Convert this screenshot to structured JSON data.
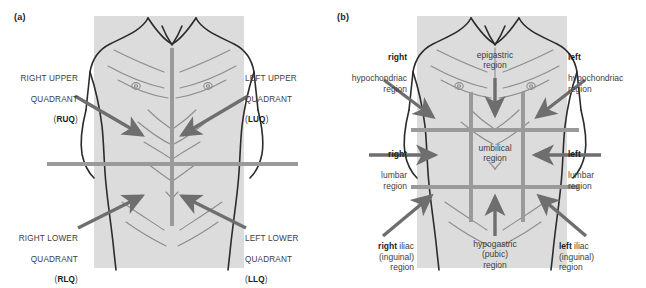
{
  "figure": {
    "colors": {
      "marker_line": "#9a9a9a",
      "arrow": "#6e6e6e",
      "body_fill": "#dcdcdc",
      "outline": "#2b2b2b",
      "text": "#3d3d3d",
      "bold_text": "#1c1c1c",
      "background": "#ffffff"
    }
  },
  "panel_a": {
    "letter": "(a)",
    "scheme": "four quadrants",
    "labels": {
      "right_upper": {
        "line1": "RIGHT UPPER",
        "line2": "QUADRANT",
        "abbrev": "RUQ",
        "align": "right"
      },
      "left_upper": {
        "line1": "LEFT UPPER",
        "line2": "QUADRANT",
        "abbrev": "LUQ",
        "align": "left"
      },
      "right_lower": {
        "line1": "RIGHT LOWER",
        "line2": "QUADRANT",
        "abbrev": "RLQ",
        "align": "right"
      },
      "left_lower": {
        "line1": "LEFT LOWER",
        "line2": "QUADRANT",
        "abbrev": "LLQ",
        "align": "left"
      }
    }
  },
  "panel_b": {
    "letter": "(b)",
    "scheme": "nine regions",
    "labels": {
      "right_hypochondriac": {
        "bold": "right",
        "rest": "hypochondriac\nregion",
        "align": "right",
        "bold_inline": false
      },
      "left_hypochondriac": {
        "bold": "left",
        "rest": "hypochondriac\nregion",
        "align": "left",
        "bold_inline": false
      },
      "epigastric": {
        "bold": "",
        "rest": "epigastric\nregion",
        "align": "center",
        "bold_inline": false
      },
      "right_lumbar": {
        "bold": "right",
        "rest": "lumbar\nregion",
        "align": "right",
        "bold_inline": false
      },
      "left_lumbar": {
        "bold": "left",
        "rest": "lumbar\nregion",
        "align": "left",
        "bold_inline": false
      },
      "umbilical": {
        "bold": "",
        "rest": "umbilical\nregion",
        "align": "center",
        "bold_inline": false
      },
      "right_iliac": {
        "bold": "right",
        "rest": " iliac\n(inguinal)\nregion",
        "align": "right",
        "bold_inline": true
      },
      "left_iliac": {
        "bold": "left",
        "rest": " iliac\n(inguinal)\nregion",
        "align": "left",
        "bold_inline": true
      },
      "hypogastric": {
        "bold": "",
        "rest": "hypogastric\n(pubic)\nregion",
        "align": "center",
        "bold_inline": false
      }
    }
  }
}
